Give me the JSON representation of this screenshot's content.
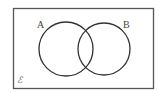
{
  "diagram": {
    "type": "venn",
    "universal_set_label": "ℰ",
    "sets": [
      {
        "label": "A",
        "cx": 66,
        "cy": 49,
        "r": 27
      },
      {
        "label": "B",
        "cx": 104,
        "cy": 49,
        "r": 26
      }
    ],
    "frame": {
      "x": 13,
      "y": 8,
      "width": 140,
      "height": 80
    },
    "colors": {
      "stroke": "#333333",
      "frame_stroke": "#555555",
      "background": "#ffffff",
      "label": "#444444"
    }
  }
}
